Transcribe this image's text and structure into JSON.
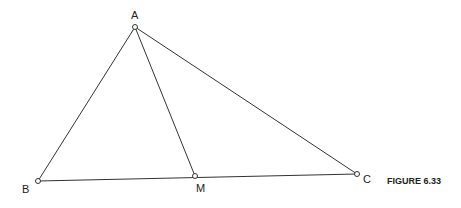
{
  "figure": {
    "caption": "FIGURE 6.33",
    "points": {
      "A": {
        "label": "A",
        "x": 135,
        "y": 27
      },
      "B": {
        "label": "B",
        "x": 38,
        "y": 181
      },
      "M": {
        "label": "M",
        "x": 195,
        "y": 176
      },
      "C": {
        "label": "C",
        "x": 357,
        "y": 174
      }
    },
    "segments": [
      "AB",
      "AC",
      "AM",
      "BC"
    ],
    "colors": {
      "stroke": "#333333",
      "background": "#ffffff"
    }
  }
}
